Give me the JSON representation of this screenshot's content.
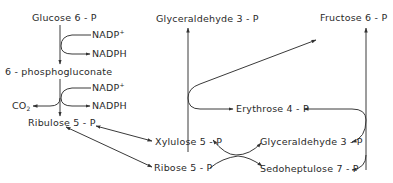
{
  "diagram": {
    "nodes": {
      "glucose6p": "Glucose 6 - P",
      "nadp1": "NADP",
      "nadp1_sup": "+",
      "nadph1": "NADPH",
      "phosphogluconate": "6 - phosphogluconate",
      "nadp2": "NADP",
      "nadp2_sup": "+",
      "nadph2": "NADPH",
      "co2": "CO",
      "co2_sub": "2",
      "ribulose5p": "Ribulose 5 - P",
      "xylulose5p": "Xylulose 5 - P",
      "ribose5p": "Ribose 5 - P",
      "glyceraldehyde3p_top": "Glyceraldehyde 3 - P",
      "fructose6p": "Fructose 6 - P",
      "erythrose4p": "Erythrose 4 - P",
      "glyceraldehyde3p_bottom": "Glyceraldehyde 3 - P",
      "sedoheptulose7p": "Sedoheptulose 7 - P"
    },
    "edges": [
      {
        "from": "Glucose 6 - P",
        "to": "6 - phosphogluconate",
        "cofactor_in": "NADP+",
        "cofactor_out": "NADPH"
      },
      {
        "from": "6 - phosphogluconate",
        "to": "Ribulose 5 - P",
        "cofactor_in": "NADP+",
        "cofactor_out": "NADPH",
        "byproduct": "CO2"
      },
      {
        "from": "Ribulose 5 - P",
        "to": "Xylulose 5 - P",
        "bidirectional": true
      },
      {
        "from": "Ribulose 5 - P",
        "to": "Ribose 5 - P",
        "bidirectional": true
      },
      {
        "from": "Xylulose 5 - P + Ribose 5 - P",
        "to": "Glyceraldehyde 3 - P + Sedoheptulose 7 - P",
        "bidirectional": true
      },
      {
        "from": "Sedoheptulose 7 - P + Glyceraldehyde 3 - P",
        "to": "Fructose 6 - P + Erythrose 4 - P"
      },
      {
        "from": "Xylulose 5 - P + Erythrose 4 - P",
        "to": "Glyceraldehyde 3 - P + Fructose 6 - P"
      }
    ]
  }
}
